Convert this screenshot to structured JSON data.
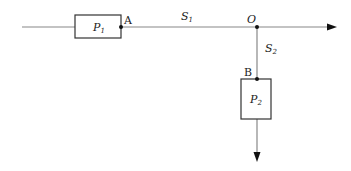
{
  "diagram": {
    "boxes": [
      {
        "id": "P1",
        "label": "P",
        "sub": "1"
      },
      {
        "id": "P2",
        "label": "P",
        "sub": "2"
      }
    ],
    "points": {
      "A": "A",
      "B": "B",
      "O": "O"
    },
    "segments": {
      "S1": {
        "label": "S",
        "sub": "1"
      },
      "S2": {
        "label": "S",
        "sub": "2"
      }
    },
    "colors": {
      "line": "#888888",
      "box": "#333333",
      "dot": "#111111"
    }
  }
}
